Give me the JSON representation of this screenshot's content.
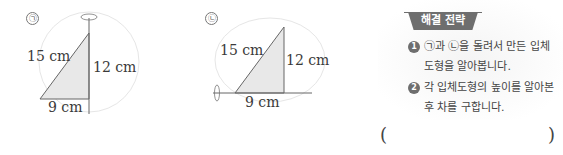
{
  "figures": [
    {
      "marker": "㉠",
      "rotation_axis": "vertical",
      "hypotenuse": "15 cm",
      "height": "12 cm",
      "base": "9 cm"
    },
    {
      "marker": "㉡",
      "rotation_axis": "horizontal",
      "hypotenuse": "15 cm",
      "height": "12 cm",
      "base": "9 cm"
    }
  ],
  "strategy": {
    "title": "해결 전략",
    "steps": [
      {
        "num": "1",
        "line1": "㉠과 ㉡을 돌려서 만든 입체",
        "line2": "도형을 알아봅니다."
      },
      {
        "num": "2",
        "line1": "각 입체도형의 높이를 알아본",
        "line2": "후 차를 구합니다."
      }
    ]
  },
  "answer": {
    "open": "(",
    "close": ")",
    "value": ""
  }
}
